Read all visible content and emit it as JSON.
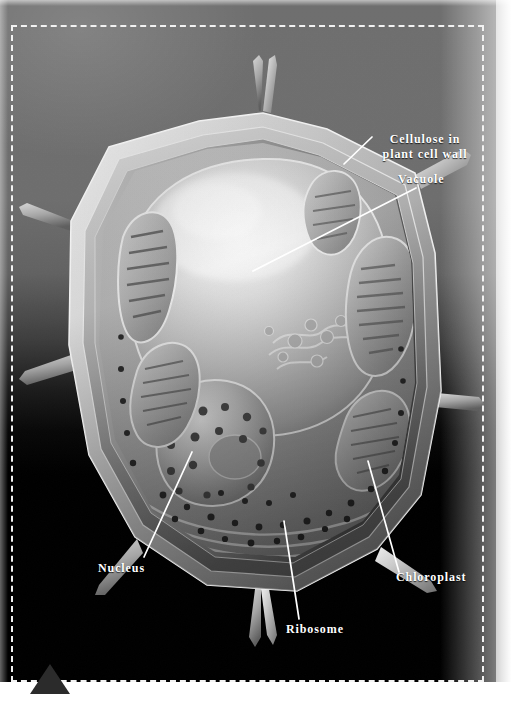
{
  "figure": {
    "medium": "grayscale electron-micrograph style illustration",
    "selection": {
      "marker": "triangle-handle"
    }
  },
  "labels": {
    "cellulose": "Cellulose in\nplant cell wall",
    "vacuole": "Vacuole",
    "nucleus": "Nucleus",
    "chloroplast": "Chloroplast",
    "ribosome": "Ribosome"
  },
  "colors": {
    "background_top": "#6f6f6f",
    "background_bottom": "#000000",
    "label_text": "#ffffff",
    "leader_line": "#ffffff",
    "selection_border": "#f2f2f2",
    "handle": "#2b2b2b",
    "cell_wall_light": "#d9d9d9",
    "cell_wall_mid": "#8e8e8e",
    "vacuole_light": "#e8e8e8",
    "cytoplasm": "#9a9a9a",
    "organelle_dark": "#2a2a2a"
  },
  "leaders": [
    {
      "name": "cellulose",
      "x1": 372,
      "y1": 137,
      "x2": 344,
      "y2": 164
    },
    {
      "name": "vacuole",
      "x1": 416,
      "y1": 188,
      "x2": 253,
      "y2": 271
    },
    {
      "name": "nucleus",
      "x1": 192,
      "y1": 452,
      "x2": 144,
      "y2": 557
    },
    {
      "name": "chloroplast",
      "x1": 368,
      "y1": 461,
      "x2": 399,
      "y2": 572
    },
    {
      "name": "ribosome",
      "x1": 284,
      "y1": 521,
      "x2": 299,
      "y2": 619
    }
  ]
}
